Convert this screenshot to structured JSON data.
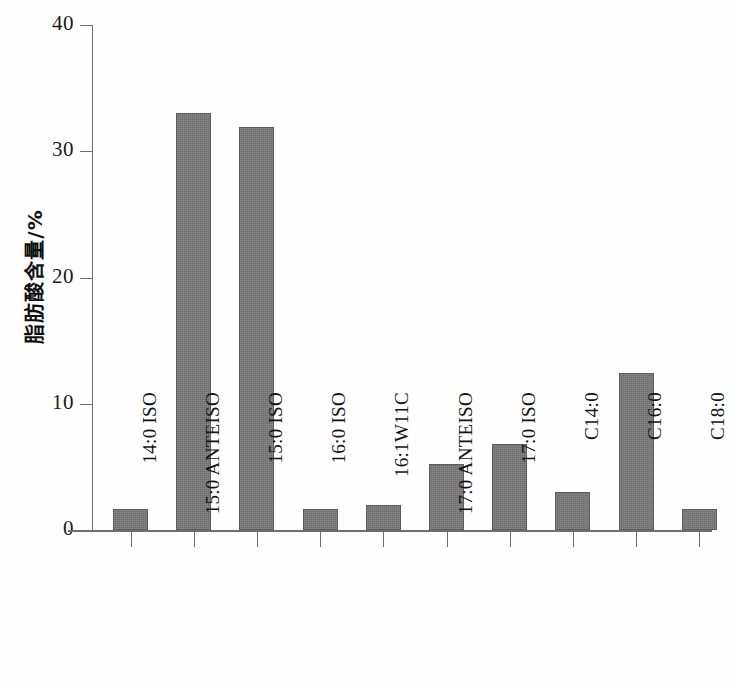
{
  "chart_data": {
    "type": "bar",
    "title": "",
    "subtitle": "",
    "xlabel": "",
    "ylabel": "脂肪酸含量/%",
    "ylim": [
      0,
      40
    ],
    "yticks": [
      0,
      10,
      20,
      30,
      40
    ],
    "ytick_labels": [
      "0",
      "10",
      "20",
      "30",
      "40"
    ],
    "grid": false,
    "legend": null,
    "bar_color": "#787878",
    "bar_edge_color": "#5c5c5c",
    "axis_color": "#6e6e6e",
    "background_color": "#fefefe",
    "categories": [
      "14:0 ISO",
      "15:0 ANTEISO",
      "15:0 ISO",
      "16:0 ISO",
      "16:1W11C",
      "17:0 ANTEISO",
      "17:0 ISO",
      "C14:0",
      "C16:0",
      "C18:0"
    ],
    "values": [
      1.7,
      33.0,
      31.9,
      1.7,
      2.0,
      5.2,
      6.8,
      3.0,
      12.4,
      1.7
    ],
    "series": [
      {
        "name": "脂肪酸含量",
        "values": [
          1.7,
          33.0,
          31.9,
          1.7,
          2.0,
          5.2,
          6.8,
          3.0,
          12.4,
          1.7
        ]
      }
    ]
  }
}
